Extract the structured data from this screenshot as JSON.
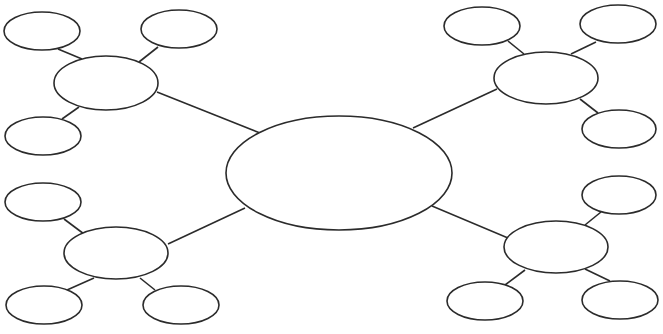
{
  "diagram": {
    "type": "bubble-map",
    "width": 663,
    "height": 334,
    "stroke_color": "#2b2b2b",
    "fill_color": "#ffffff",
    "center": {
      "cx": 339,
      "cy": 173,
      "rx": 113,
      "ry": 57,
      "label": ""
    },
    "hubs": [
      {
        "id": "top-left",
        "cx": 106,
        "cy": 83,
        "rx": 52,
        "ry": 27,
        "label": "",
        "link": {
          "x1": 157,
          "y1": 92,
          "x2": 260,
          "y2": 133
        },
        "children": [
          {
            "cx": 42,
            "cy": 31,
            "rx": 38,
            "ry": 19,
            "label": "",
            "link": {
              "x1": 58,
              "y1": 49,
              "x2": 82,
              "y2": 59
            }
          },
          {
            "cx": 179,
            "cy": 29,
            "rx": 38,
            "ry": 19,
            "label": "",
            "link": {
              "x1": 158,
              "y1": 47,
              "x2": 139,
              "y2": 62
            }
          },
          {
            "cx": 43,
            "cy": 136,
            "rx": 38,
            "ry": 19,
            "label": "",
            "link": {
              "x1": 62,
              "y1": 119,
              "x2": 79,
              "y2": 107
            }
          }
        ]
      },
      {
        "id": "top-right",
        "cx": 546,
        "cy": 78,
        "rx": 52,
        "ry": 26,
        "label": "",
        "link": {
          "x1": 497,
          "y1": 89,
          "x2": 413,
          "y2": 128
        },
        "children": [
          {
            "cx": 482,
            "cy": 26,
            "rx": 38,
            "ry": 19,
            "label": "",
            "link": {
              "x1": 508,
              "y1": 41,
              "x2": 524,
              "y2": 54
            }
          },
          {
            "cx": 618,
            "cy": 24,
            "rx": 38,
            "ry": 19,
            "label": "",
            "link": {
              "x1": 596,
              "y1": 42,
              "x2": 571,
              "y2": 54
            }
          },
          {
            "cx": 619,
            "cy": 129,
            "rx": 37,
            "ry": 19,
            "label": "",
            "link": {
              "x1": 598,
              "y1": 113,
              "x2": 580,
              "y2": 99
            }
          }
        ]
      },
      {
        "id": "bottom-left",
        "cx": 116,
        "cy": 253,
        "rx": 52,
        "ry": 26,
        "label": "",
        "link": {
          "x1": 168,
          "y1": 244,
          "x2": 245,
          "y2": 208
        },
        "children": [
          {
            "cx": 43,
            "cy": 202,
            "rx": 38,
            "ry": 19,
            "label": "",
            "link": {
              "x1": 64,
              "y1": 219,
              "x2": 84,
              "y2": 234
            }
          },
          {
            "cx": 44,
            "cy": 305,
            "rx": 38,
            "ry": 19,
            "label": "",
            "link": {
              "x1": 67,
              "y1": 290,
              "x2": 94,
              "y2": 278
            }
          },
          {
            "cx": 181,
            "cy": 305,
            "rx": 38,
            "ry": 19,
            "label": "",
            "link": {
              "x1": 155,
              "y1": 290,
              "x2": 140,
              "y2": 278
            }
          }
        ]
      },
      {
        "id": "bottom-right",
        "cx": 556,
        "cy": 247,
        "rx": 52,
        "ry": 26,
        "label": "",
        "link": {
          "x1": 508,
          "y1": 238,
          "x2": 432,
          "y2": 206
        },
        "children": [
          {
            "cx": 619,
            "cy": 195,
            "rx": 37,
            "ry": 19,
            "label": "",
            "link": {
              "x1": 601,
              "y1": 212,
              "x2": 585,
              "y2": 225
            }
          },
          {
            "cx": 485,
            "cy": 301,
            "rx": 38,
            "ry": 19,
            "label": "",
            "link": {
              "x1": 505,
              "y1": 285,
              "x2": 525,
              "y2": 270
            }
          },
          {
            "cx": 620,
            "cy": 300,
            "rx": 38,
            "ry": 19,
            "label": "",
            "link": {
              "x1": 610,
              "y1": 281,
              "x2": 585,
              "y2": 269
            }
          }
        ]
      }
    ]
  }
}
